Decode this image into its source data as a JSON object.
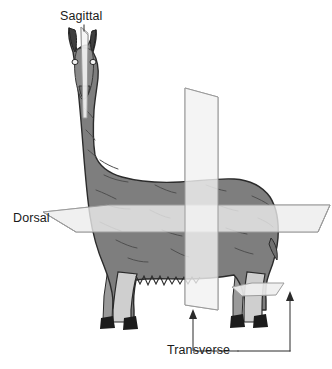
{
  "figure": {
    "background_color": "#ffffff",
    "width": 332,
    "height": 369
  },
  "subject": {
    "name": "llama",
    "orientation": "front-left three-quarter view, standing",
    "body_color": "#7e7e7e",
    "body_shadow_color": "#6b6b6b",
    "outline_color": "#2b2b2b",
    "leg_light_color": "#d8d8d8",
    "hoof_color": "#1c1c1c",
    "ear_color": "#4a4a4a"
  },
  "planes": [
    {
      "id": "sagittal",
      "label": "Sagittal",
      "orientation": "vertical, median, splits head left-right",
      "fill_color": "#f2f2f2",
      "stroke_color": "#9a9a9a",
      "has_leader_line": true
    },
    {
      "id": "dorsal",
      "label": "Dorsal",
      "orientation": "horizontal, splits body top-bottom",
      "fill_color": "#f0f0f0",
      "stroke_color": "#a0a0a0",
      "has_leader_line": false
    },
    {
      "id": "transverse",
      "label": "Transverse",
      "orientation": "vertical, cross-sectional, splits body front-back",
      "fill_color": "#f2f2f2",
      "stroke_color": "#9a9a9a",
      "has_leader_line": true,
      "arrow_count": 2
    },
    {
      "id": "transverse-limb",
      "label": "Transverse",
      "orientation": "horizontal, cross-section through hind limb",
      "fill_color": "#efefef",
      "stroke_color": "#a0a0a0",
      "has_leader_line": true
    }
  ],
  "labels": {
    "sagittal": "Sagittal",
    "dorsal": "Dorsal",
    "transverse": "Transverse"
  },
  "leader_lines": {
    "color": "#2b2b2b",
    "width": 1
  }
}
